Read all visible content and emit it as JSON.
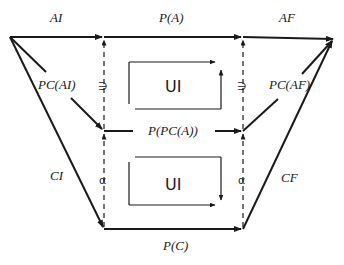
{
  "diagram": {
    "type": "commutative-diagram",
    "nodes": {
      "top_left": "origin",
      "top_right": "target"
    },
    "edges": {
      "top_left_segment": "AI",
      "top_middle_segment": "P(A)",
      "top_right_segment": "AF",
      "inner_left_diagonal": "PC(AI)",
      "inner_right_diagonal": "PC(AF)",
      "middle_horizontal": "P(PC(A))",
      "outer_left_diagonal": "CI",
      "outer_right_diagonal": "CF",
      "bottom_horizontal": "P(C)"
    },
    "vertical_maps": {
      "upper_left": "∋",
      "upper_right": "∋",
      "lower_left": "α",
      "lower_right": "α"
    },
    "inner_boxes": [
      {
        "label": "UI",
        "position": "upper"
      },
      {
        "label": "UI",
        "position": "lower"
      }
    ]
  },
  "colors": {
    "stroke": "#1a1a1a",
    "background": "#ffffff"
  }
}
